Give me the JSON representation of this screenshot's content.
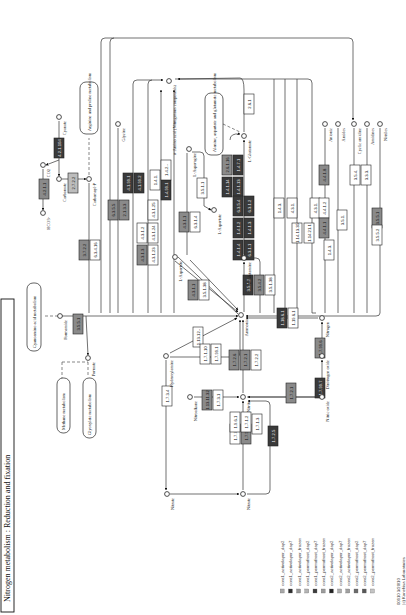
{
  "title": "Nitrogen metabolism : Reduction and fixation",
  "footer": {
    "line1": "00910 3/20/10",
    "line2": "(c) Kanehisa Laboratories"
  },
  "colors": {
    "white": "#ffffff",
    "light": "#bdbdbd",
    "mid": "#8a8a8a",
    "dark": "#3a3a3a",
    "line": "#333333"
  },
  "maps": [
    {
      "id": "cyanoamino",
      "label": "Cyanoamino acid metabolism",
      "x": 27,
      "y": 283,
      "w": 14,
      "h": 68
    },
    {
      "id": "methane",
      "label": "Methane metabolism",
      "x": 57,
      "y": 378,
      "w": 13,
      "h": 55
    },
    {
      "id": "glyoxylate",
      "label": "Glyoxylate metabolism",
      "x": 83,
      "y": 378,
      "w": 13,
      "h": 60
    },
    {
      "id": "arginine",
      "label": "Arginine and proline metabolism",
      "x": 80,
      "y": 82,
      "w": 18,
      "h": 52
    },
    {
      "id": "alanine",
      "label": "Alanine, aspartate and glutamate metabolism",
      "x": 205,
      "y": 93,
      "w": 18,
      "h": 62
    }
  ],
  "compounds": [
    {
      "id": "ammonia",
      "label": "Ammonia",
      "x": 241,
      "y": 315
    },
    {
      "id": "formamide",
      "label": "Formamide",
      "x": 60,
      "y": 316
    },
    {
      "id": "formate",
      "label": "Formate",
      "x": 88,
      "y": 358
    },
    {
      "id": "hydroxylamine",
      "label": "Hydroxylamine",
      "x": 166,
      "y": 356
    },
    {
      "id": "nitroalkane",
      "label": "Nitroalkane",
      "x": 190,
      "y": 397
    },
    {
      "id": "nitrite",
      "label": "Nitrite",
      "x": 243,
      "y": 397
    },
    {
      "id": "nitrate1",
      "label": "Nitrate",
      "x": 167,
      "y": 494
    },
    {
      "id": "nitrate2",
      "label": "Nitrate",
      "x": 243,
      "y": 494
    },
    {
      "id": "nitric_oxide",
      "label": "Nitric oxide",
      "x": 322,
      "y": 397
    },
    {
      "id": "nitrous_oxide",
      "label": "Dinitrogen oxide",
      "x": 322,
      "y": 356
    },
    {
      "id": "nitrogen",
      "label": "Nitrogen",
      "x": 322,
      "y": 318
    },
    {
      "id": "carbamate",
      "label": "Carbamate",
      "x": 59,
      "y": 179
    },
    {
      "id": "carbamoyl_p",
      "label": "Carbamoyl-P",
      "x": 89,
      "y": 179
    },
    {
      "id": "co2",
      "label": "CO2",
      "x": 43,
      "y": 165
    },
    {
      "id": "hco3",
      "label": "HCO3-",
      "x": 43,
      "y": 213
    },
    {
      "id": "cyanate",
      "label": "Cyanate",
      "x": 59,
      "y": 117
    },
    {
      "id": "glycine",
      "label": "Glycine",
      "x": 118,
      "y": 124
    },
    {
      "id": "aa",
      "label": "α-Amino acid (Nitrogenous compounds)",
      "x": 169,
      "y": 81
    },
    {
      "id": "l_asparagine",
      "label": "L-Asparagine",
      "x": 189,
      "y": 149
    },
    {
      "id": "l_aspartate_right",
      "label": "L-Aspartate",
      "x": 214,
      "y": 210
    },
    {
      "id": "l_aspartate",
      "label": "L-Aspartate",
      "x": 175,
      "y": 257
    },
    {
      "id": "l_glutamine",
      "label": "L-Glutamine",
      "x": 244,
      "y": 258
    },
    {
      "id": "l_glutamate",
      "label": "L-Glutamate",
      "x": 244,
      "y": 136
    },
    {
      "id": "anionic",
      "label": "Anionic",
      "x": 325,
      "y": 124
    },
    {
      "id": "amides",
      "label": "Amides",
      "x": 338,
      "y": 124
    },
    {
      "id": "cyclic_amidine",
      "label": "Cyclic amidine",
      "x": 354,
      "y": 124
    },
    {
      "id": "amidines",
      "label": "Amidines",
      "x": 367,
      "y": 124
    },
    {
      "id": "nitriles",
      "label": "Nitriles",
      "x": 380,
      "y": 124
    }
  ],
  "enzymes": [
    {
      "label": "4.2.1.104",
      "x": 54,
      "y": 138,
      "w": 11,
      "h": 22,
      "fill": "dark"
    },
    {
      "label": "4.2.1.1",
      "x": 39,
      "y": 179,
      "w": 11,
      "h": 22,
      "fill": "mid"
    },
    {
      "label": "2.7.2.2",
      "x": 68,
      "y": 173,
      "w": 11,
      "h": 22,
      "fill": "light"
    },
    {
      "label": "3.7.2.2",
      "x": 79,
      "y": 240,
      "w": 11,
      "h": 22,
      "fill": "mid"
    },
    {
      "label": "6.3.4.16",
      "x": 90,
      "y": 240,
      "w": 11,
      "h": 22,
      "fill": "white"
    },
    {
      "label": "6.3.5.5",
      "x": 108,
      "y": 200,
      "w": 11,
      "h": 22,
      "fill": "mid"
    },
    {
      "label": "2.1.3.3",
      "x": 119,
      "y": 200,
      "w": 11,
      "h": 22,
      "fill": "mid"
    },
    {
      "label": "4.1.99.1",
      "x": 123,
      "y": 173,
      "w": 11,
      "h": 22,
      "fill": "dark"
    },
    {
      "label": "4.1.99.2",
      "x": 134,
      "y": 173,
      "w": 11,
      "h": 22,
      "fill": "dark"
    },
    {
      "label": "4.3.1.2",
      "x": 137,
      "y": 223,
      "w": 11,
      "h": 22,
      "fill": "white"
    },
    {
      "label": "4.3.1.25",
      "x": 148,
      "y": 200,
      "w": 11,
      "h": 22,
      "fill": "white"
    },
    {
      "label": "4.3.1.3",
      "x": 137,
      "y": 245,
      "w": 11,
      "h": 22,
      "fill": "mid"
    },
    {
      "label": "4.3.1.24",
      "x": 148,
      "y": 223,
      "w": 11,
      "h": 22,
      "fill": "white"
    },
    {
      "label": "4.3.1.23",
      "x": 148,
      "y": 245,
      "w": 11,
      "h": 22,
      "fill": "white"
    },
    {
      "label": "1.4.1.",
      "x": 150,
      "y": 170,
      "w": 11,
      "h": 22,
      "fill": "white"
    },
    {
      "label": "1.4.99.1",
      "x": 161,
      "y": 180,
      "w": 11,
      "h": 22,
      "fill": "dark"
    },
    {
      "label": "1.4.2.-",
      "x": 161,
      "y": 160,
      "w": 11,
      "h": 22,
      "fill": "white"
    },
    {
      "label": "4.3.1.1",
      "x": 179,
      "y": 212,
      "w": 11,
      "h": 22,
      "fill": "mid"
    },
    {
      "label": "6.3.1.4",
      "x": 190,
      "y": 212,
      "w": 11,
      "h": 22,
      "fill": "white"
    },
    {
      "label": "3.5.1.1",
      "x": 197,
      "y": 178,
      "w": 11,
      "h": 22,
      "fill": "white"
    },
    {
      "label": "3.5.1.38",
      "x": 199,
      "y": 280,
      "w": 11,
      "h": 22,
      "fill": "white"
    },
    {
      "label": "4.3.1.1",
      "x": 188,
      "y": 280,
      "w": 11,
      "h": 22,
      "fill": "mid"
    },
    {
      "label": "2.6.1.16",
      "x": 222,
      "y": 155,
      "w": 11,
      "h": 22,
      "fill": "mid"
    },
    {
      "label": "1.4.1.14",
      "x": 222,
      "y": 177,
      "w": 11,
      "h": 22,
      "fill": "dark"
    },
    {
      "label": "1.4.7.1",
      "x": 233,
      "y": 155,
      "w": 11,
      "h": 22,
      "fill": "dark"
    },
    {
      "label": "1.4.1.13",
      "x": 233,
      "y": 177,
      "w": 11,
      "h": 22,
      "fill": "dark"
    },
    {
      "label": "6.3.5.4",
      "x": 233,
      "y": 196,
      "w": 11,
      "h": 22,
      "fill": "dark"
    },
    {
      "label": "6.3.1.2",
      "x": 244,
      "y": 196,
      "w": 11,
      "h": 22,
      "fill": "dark"
    },
    {
      "label": "1.4.1.2",
      "x": 233,
      "y": 218,
      "w": 11,
      "h": 22,
      "fill": "dark"
    },
    {
      "label": "1.4.1.3",
      "x": 244,
      "y": 218,
      "w": 11,
      "h": 22,
      "fill": "dark"
    },
    {
      "label": "1.4.1.4",
      "x": 233,
      "y": 240,
      "w": 11,
      "h": 22,
      "fill": "dark"
    },
    {
      "label": "6.3.1.1",
      "x": 244,
      "y": 240,
      "w": 11,
      "h": 22,
      "fill": "dark"
    },
    {
      "label": "3.5.1.2",
      "x": 243,
      "y": 275,
      "w": 11,
      "h": 22,
      "fill": "dark"
    },
    {
      "label": "3.5.1.38",
      "x": 265,
      "y": 275,
      "w": 11,
      "h": 22,
      "fill": "white"
    },
    {
      "label": "3.5.4.2",
      "x": 254,
      "y": 275,
      "w": 11,
      "h": 22,
      "fill": "mid"
    },
    {
      "label": "2.6.1",
      "x": 244,
      "y": 94,
      "w": 11,
      "h": 22,
      "fill": "white"
    },
    {
      "label": "1.4.3.",
      "x": 274,
      "y": 198,
      "w": 11,
      "h": 22,
      "fill": "white"
    },
    {
      "label": "4.3.1.",
      "x": 287,
      "y": 198,
      "w": 11,
      "h": 22,
      "fill": "white"
    },
    {
      "label": "1.14.13.35",
      "x": 292,
      "y": 223,
      "w": 11,
      "h": 22,
      "fill": "white"
    },
    {
      "label": "1.14.21.1",
      "x": 304,
      "y": 223,
      "w": 11,
      "h": 22,
      "fill": "white"
    },
    {
      "label": "4.3.1.",
      "x": 310,
      "y": 198,
      "w": 11,
      "h": 22,
      "fill": "white"
    },
    {
      "label": "4.4.1.2",
      "x": 319,
      "y": 198,
      "w": 11,
      "h": 22,
      "fill": "white"
    },
    {
      "label": "4.4.1.8",
      "x": 319,
      "y": 165,
      "w": 11,
      "h": 22,
      "fill": "mid"
    },
    {
      "label": "4.4.1.1",
      "x": 319,
      "y": 218,
      "w": 11,
      "h": 22,
      "fill": "mid"
    },
    {
      "label": "1.4.3.",
      "x": 324,
      "y": 240,
      "w": 11,
      "h": 22,
      "fill": "white"
    },
    {
      "label": "3.5.1.",
      "x": 337,
      "y": 210,
      "w": 11,
      "h": 22,
      "fill": "white"
    },
    {
      "label": "3.5.4.",
      "x": 350,
      "y": 165,
      "w": 11,
      "h": 22,
      "fill": "white"
    },
    {
      "label": "3.3.3.",
      "x": 361,
      "y": 165,
      "w": 11,
      "h": 22,
      "fill": "white"
    },
    {
      "label": "3.5.5.1",
      "x": 372,
      "y": 208,
      "w": 11,
      "h": 22,
      "fill": "mid"
    },
    {
      "label": "3.5.5.2",
      "x": 372,
      "y": 225,
      "w": 11,
      "h": 22,
      "fill": "white"
    },
    {
      "label": "3.5.5.1",
      "x": 73,
      "y": 314,
      "w": 11,
      "h": 22,
      "fill": "mid"
    },
    {
      "label": "1.13.12.-",
      "x": 193,
      "y": 327,
      "w": 11,
      "h": 22,
      "fill": "white"
    },
    {
      "label": "1.7.1.10",
      "x": 200,
      "y": 344,
      "w": 11,
      "h": 22,
      "fill": "white"
    },
    {
      "label": "1.7.99.1",
      "x": 211,
      "y": 344,
      "w": 11,
      "h": 22,
      "fill": "white"
    },
    {
      "label": "1.7.3.4",
      "x": 162,
      "y": 386,
      "w": 11,
      "h": 22,
      "fill": "white"
    },
    {
      "label": "1.7.2.6",
      "x": 229,
      "y": 350,
      "w": 11,
      "h": 22,
      "fill": "mid"
    },
    {
      "label": "1.7.2.1",
      "x": 240,
      "y": 350,
      "w": 11,
      "h": 22,
      "fill": "mid"
    },
    {
      "label": "1.7.2.2",
      "x": 251,
      "y": 350,
      "w": 11,
      "h": 22,
      "fill": "white"
    },
    {
      "label": "1.13.11.32",
      "x": 202,
      "y": 390,
      "w": 11,
      "h": 22,
      "fill": "mid"
    },
    {
      "label": "1.7.3.1",
      "x": 213,
      "y": 390,
      "w": 11,
      "h": 22,
      "fill": "white"
    },
    {
      "label": "1.7.7.2",
      "x": 230,
      "y": 424,
      "w": 11,
      "h": 22,
      "fill": "white"
    },
    {
      "label": "1.9.6.1",
      "x": 230,
      "y": 412,
      "w": 11,
      "h": 22,
      "fill": "white"
    },
    {
      "label": "1.7.5.1",
      "x": 241,
      "y": 424,
      "w": 11,
      "h": 22,
      "fill": "mid"
    },
    {
      "label": "1.7.1.2",
      "x": 241,
      "y": 412,
      "w": 11,
      "h": 22,
      "fill": "white"
    },
    {
      "label": "1.7.1.3",
      "x": 252,
      "y": 414,
      "w": 11,
      "h": 22,
      "fill": "white"
    },
    {
      "label": "1.7.2.5",
      "x": 268,
      "y": 426,
      "w": 11,
      "h": 22,
      "fill": "dark"
    },
    {
      "label": "1.7.2.1",
      "x": 286,
      "y": 383,
      "w": 11,
      "h": 22,
      "fill": "mid"
    },
    {
      "label": "1.7.99.7",
      "x": 315,
      "y": 378,
      "w": 11,
      "h": 22,
      "fill": "dark"
    },
    {
      "label": "1.7.99.6",
      "x": 315,
      "y": 338,
      "w": 11,
      "h": 22,
      "fill": "mid"
    },
    {
      "label": "1.18.6.1",
      "x": 277,
      "y": 308,
      "w": 11,
      "h": 22,
      "fill": "dark"
    },
    {
      "label": "1.19.6.1",
      "x": 288,
      "y": 308,
      "w": 11,
      "h": 22,
      "fill": "white"
    }
  ],
  "legend": {
    "items": [
      {
        "label": "core1_activelayer_day2",
        "color": "#a8a8a8"
      },
      {
        "label": "core1_activelayer_day7",
        "color": "#2e2e2e"
      },
      {
        "label": "core1_activelayer_frozen",
        "color": "#9a9a9a"
      },
      {
        "label": "core1_permafrost_day2",
        "color": "#b4b4b4"
      },
      {
        "label": "core1_permafrost_day7",
        "color": "#3c3c3c"
      },
      {
        "label": "core1_permafrost_frozen",
        "color": "#9c9c9c"
      },
      {
        "label": "core2_activelayer_day2",
        "color": "#242424"
      },
      {
        "label": "core2_activelayer_day7",
        "color": "#b0b0b0"
      },
      {
        "label": "core2_activelayer_frozen",
        "color": "#a0a0a0"
      },
      {
        "label": "core2_permafrost_day2",
        "color": "#6a6a6a"
      },
      {
        "label": "core2_permafrost_day7",
        "color": "#585858"
      },
      {
        "label": "core2_permafrost_frozen",
        "color": "#c4c4c4"
      }
    ]
  }
}
